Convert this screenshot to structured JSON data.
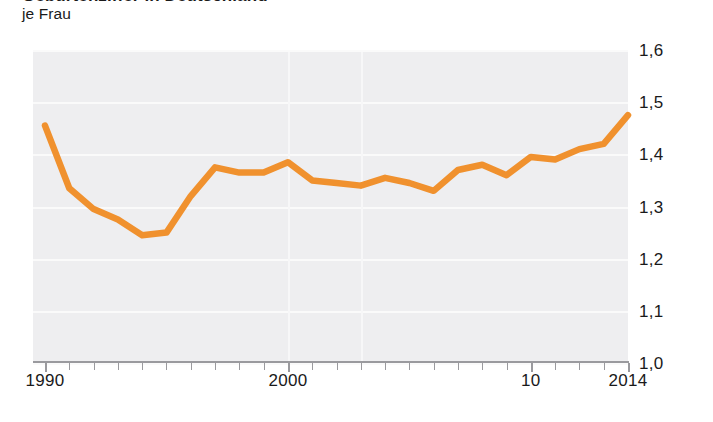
{
  "figure": {
    "title_clipped": "Geburtenziffer in Deutschland",
    "subtitle": "je Frau"
  },
  "axis": {
    "y_labels": [
      "1,6",
      "1,5",
      "1,4",
      "1,3",
      "1,2",
      "1,1",
      "1,0"
    ],
    "x_labels": [
      {
        "text": "1990",
        "year": 1990
      },
      {
        "text": "2000",
        "year": 2000
      },
      {
        "text": "10",
        "year": 2010
      },
      {
        "text": "2014",
        "year": 2014
      }
    ]
  },
  "colors": {
    "line": "#F0912E",
    "plot_background": "#EEEEF0",
    "gridline": "#FAFAFA",
    "axis": "#9A9A9E",
    "text": "#1A1A1A"
  },
  "chart_data": {
    "type": "line",
    "title": "Geburtenziffer in Deutschland",
    "subtitle": "je Frau",
    "xlabel": "",
    "ylabel": "je Frau",
    "ylim": [
      1.0,
      1.6
    ],
    "xlim": [
      1990,
      2014
    ],
    "grid": true,
    "legend": "none",
    "x": [
      1990,
      1991,
      1992,
      1993,
      1994,
      1995,
      1996,
      1997,
      1998,
      1999,
      2000,
      2001,
      2002,
      2003,
      2004,
      2005,
      2006,
      2007,
      2008,
      2009,
      2010,
      2011,
      2012,
      2013,
      2014
    ],
    "series": [
      {
        "name": "Geburtenziffer",
        "values": [
          1.455,
          1.335,
          1.295,
          1.275,
          1.245,
          1.25,
          1.32,
          1.375,
          1.365,
          1.365,
          1.385,
          1.35,
          1.345,
          1.34,
          1.355,
          1.345,
          1.33,
          1.37,
          1.38,
          1.36,
          1.395,
          1.39,
          1.41,
          1.42,
          1.475
        ]
      }
    ]
  }
}
